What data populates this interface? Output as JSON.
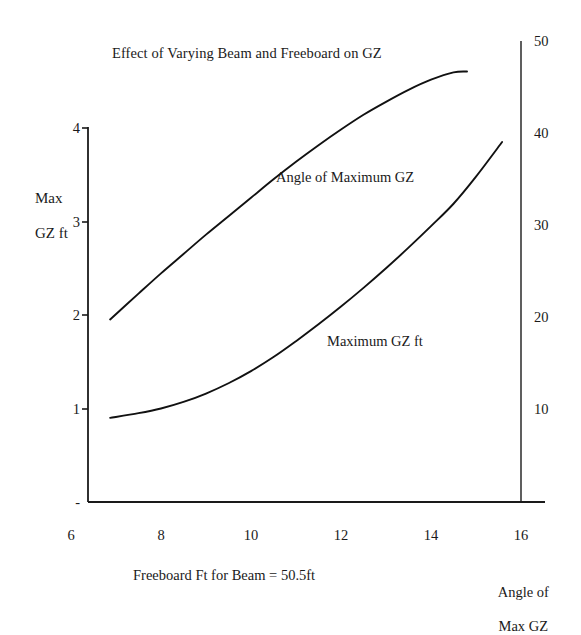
{
  "chart_data": {
    "type": "line",
    "title": "Effect of Varying Beam and Freeboard on GZ",
    "xlabel": "Freeboard Ft for Beam = 50.5ft",
    "ylabel": "Max\nGZ ft",
    "ylabel_line1": "Max",
    "ylabel_line2": "GZ ft",
    "y2label_line1": "Angle of",
    "y2label_line2": "Max GZ",
    "grid": false,
    "legend": "inline-annotations",
    "xlim": [
      6,
      16
    ],
    "ylim": [
      0,
      4
    ],
    "y2lim": [
      0,
      50
    ],
    "xticks": [
      "6",
      "8",
      "10",
      "12",
      "14",
      "16"
    ],
    "xtick_values": [
      6,
      8,
      10,
      12,
      14,
      16
    ],
    "yticks_left": [
      "4",
      "3",
      "2",
      "1",
      "-"
    ],
    "ytick_left_values": [
      4,
      3,
      2,
      1,
      0
    ],
    "yticks_right": [
      "50",
      "40",
      "30",
      "20",
      "10"
    ],
    "ytick_right_values": [
      50,
      40,
      30,
      20,
      10
    ],
    "series": [
      {
        "name": "Maximum GZ ft",
        "axis": "left",
        "units": "ft",
        "x": [
          6.87,
          7.5,
          8.0,
          8.5,
          9.0,
          9.5,
          10.0,
          10.5,
          11.0,
          11.5,
          12.0,
          12.5,
          13.0,
          13.5,
          14.0,
          14.5,
          15.0,
          15.58
        ],
        "values": [
          0.9,
          0.95,
          1.0,
          1.07,
          1.16,
          1.27,
          1.4,
          1.55,
          1.72,
          1.9,
          2.09,
          2.29,
          2.5,
          2.72,
          2.95,
          3.19,
          3.48,
          3.85
        ]
      },
      {
        "name": "Angle of Maximum GZ",
        "axis": "right",
        "units": "degrees",
        "x": [
          6.87,
          7.5,
          8.0,
          8.5,
          9.0,
          9.5,
          10.0,
          10.5,
          11.0,
          11.5,
          12.0,
          12.5,
          13.0,
          13.5,
          14.0,
          14.5,
          14.8
        ],
        "values": [
          19.8,
          22.6,
          24.8,
          26.9,
          29.0,
          31.0,
          33.0,
          35.0,
          36.9,
          38.7,
          40.4,
          42.0,
          43.4,
          44.7,
          45.8,
          46.6,
          46.7
        ]
      }
    ]
  },
  "colors": {
    "ink": "#1a1a1a",
    "background": "#ffffff",
    "curve": "#111111",
    "axis": "#1a1a1a"
  }
}
